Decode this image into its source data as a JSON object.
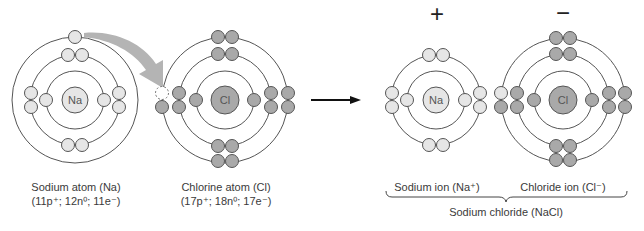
{
  "colors": {
    "orbit": "#555555",
    "sodium_fill": "#e6e6e6",
    "chlorine_fill": "#a9a9a9",
    "transfer_arrow": "#b4b4b4",
    "reaction_arrow": "#111111",
    "text": "#3a3a3a"
  },
  "sodium_atom": {
    "symbol": "Na",
    "name": "Sodium atom (Na)",
    "composition": "(11p⁺; 12n⁰; 11e⁻)",
    "center": [
      75,
      100
    ],
    "shells": [
      2,
      8,
      1
    ]
  },
  "chlorine_atom": {
    "symbol": "Cl",
    "name": "Chlorine atom (Cl)",
    "composition": "(17p⁺; 18n⁰; 17e⁻)",
    "center": [
      225,
      100
    ],
    "shells": [
      2,
      8,
      7
    ]
  },
  "transfer_arrow": {
    "label": "electron transfer",
    "icon": "curved-arrow-icon"
  },
  "reaction_arrow": {
    "icon": "right-arrow-icon"
  },
  "sodium_ion": {
    "symbol": "Na",
    "charge": "+",
    "name": "Sodium ion (Na⁺)",
    "center": [
      436,
      100
    ],
    "shells": [
      2,
      8
    ]
  },
  "chloride_ion": {
    "symbol": "Cl",
    "charge": "−",
    "name": "Chloride ion (Cl⁻)",
    "center": [
      563,
      100
    ],
    "shells": [
      2,
      8,
      8
    ]
  },
  "product": {
    "name": "Sodium chloride (NaCl)",
    "icon": "curly-brace-icon"
  }
}
